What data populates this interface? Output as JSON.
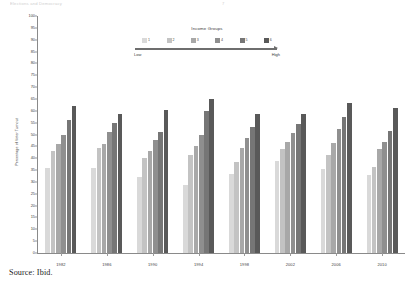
{
  "page": {
    "header_faded": "Elections and Democracy",
    "page_number": "7",
    "source_note": "Source: Ibid."
  },
  "legend": {
    "title": "Income Groups",
    "low_label": "Low",
    "high_label": "High",
    "items": [
      {
        "num": "1",
        "color": "#d9d9d9"
      },
      {
        "num": "2",
        "color": "#c3c3c3"
      },
      {
        "num": "3",
        "color": "#a8a8a8"
      },
      {
        "num": "4",
        "color": "#8f8f8f"
      },
      {
        "num": "5",
        "color": "#767676"
      },
      {
        "num": "6",
        "color": "#595959"
      }
    ]
  },
  "chart_data": {
    "type": "bar",
    "title": "",
    "xlabel": "",
    "ylabel": "Percentage of Voter Turnout",
    "ylim": [
      0,
      100
    ],
    "ytick_step": 5,
    "yticks": [
      "100",
      "95",
      "90",
      "85",
      "80",
      "75",
      "70",
      "65",
      "60",
      "55",
      "50",
      "45",
      "40",
      "35",
      "30",
      "25",
      "20",
      "15",
      "10",
      "5",
      "0"
    ],
    "grid": false,
    "legend_position": "top-center",
    "categories": [
      "1982",
      "1986",
      "1990",
      "1994",
      "1998",
      "2002",
      "2006",
      "2010"
    ],
    "series": [
      {
        "name": "1",
        "color": "#d9d9d9",
        "values": [
          36.0,
          36.0,
          32.0,
          28.5,
          33.5,
          39.0,
          35.5,
          33.0
        ]
      },
      {
        "name": "2",
        "color": "#c3c3c3",
        "values": [
          43.0,
          44.5,
          40.0,
          41.5,
          38.5,
          44.0,
          41.5,
          36.5
        ]
      },
      {
        "name": "3",
        "color": "#a8a8a8",
        "values": [
          46.0,
          46.0,
          43.0,
          45.0,
          44.5,
          47.0,
          46.5,
          44.0
        ]
      },
      {
        "name": "4",
        "color": "#8f8f8f",
        "values": [
          50.0,
          51.0,
          47.5,
          50.0,
          48.5,
          50.5,
          52.5,
          47.0
        ]
      },
      {
        "name": "5",
        "color": "#767676",
        "values": [
          56.0,
          55.0,
          51.0,
          60.0,
          53.0,
          54.5,
          57.5,
          51.5
        ]
      },
      {
        "name": "6",
        "color": "#595959",
        "values": [
          62.0,
          58.5,
          60.5,
          65.0,
          58.5,
          58.5,
          63.5,
          61.0
        ]
      }
    ]
  }
}
